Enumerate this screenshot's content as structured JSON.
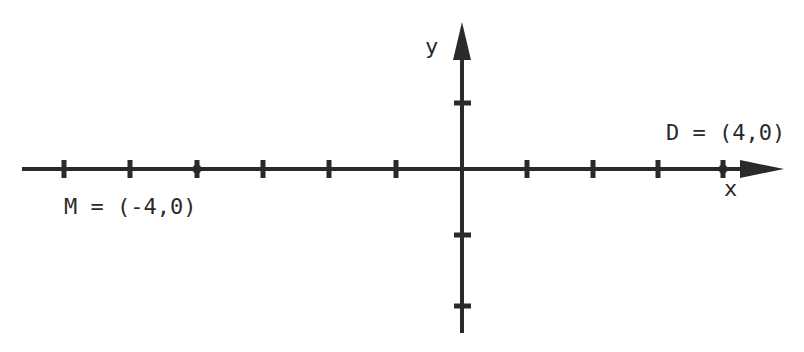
{
  "diagram": {
    "type": "coordinate-plane",
    "axes": {
      "x_label": "x",
      "y_label": "y",
      "x_ticks": [
        -6,
        -5,
        -4,
        -3,
        -2,
        -1,
        1,
        2,
        3,
        4
      ],
      "y_ticks": [
        1,
        -1,
        -2
      ]
    },
    "points": [
      {
        "name": "M",
        "label": "M = (-4,0)",
        "x": -4,
        "y": 0
      },
      {
        "name": "D",
        "label": "D = (4,0)",
        "x": 4,
        "y": 0
      }
    ],
    "colors": {
      "ink": "#2a2a2a",
      "background": "#ffffff"
    }
  }
}
